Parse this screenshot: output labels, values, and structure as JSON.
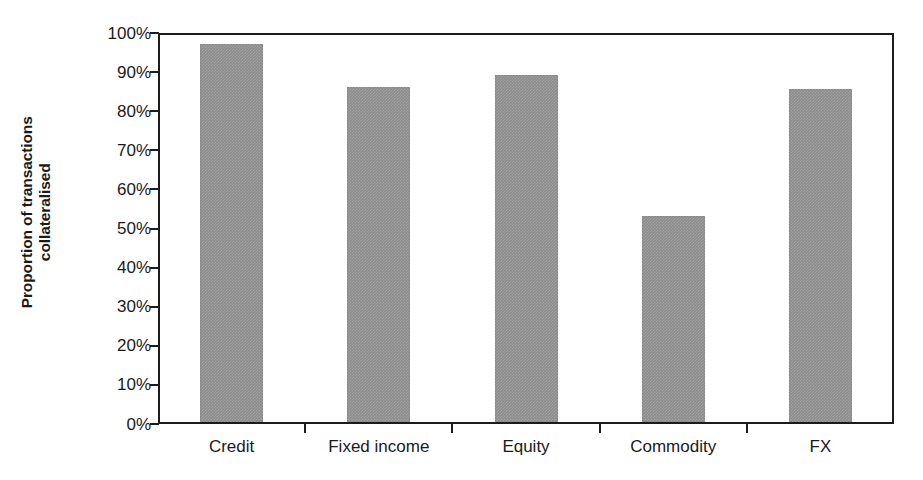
{
  "chart_data": {
    "type": "bar",
    "title": "",
    "subtitle": "",
    "xlabel": "",
    "ylabel": "Proportion of transactions collateralised",
    "ylabel_line1": "Proportion of transactions",
    "ylabel_line2": "collateralised",
    "categories": [
      "Credit",
      "Fixed income",
      "Equity",
      "Commodity",
      "FX"
    ],
    "values": [
      96.7,
      85.7,
      88.7,
      52.7,
      85.2
    ],
    "value_unit": "%",
    "ylim": [
      0,
      100
    ],
    "ytick_values": [
      0,
      10,
      20,
      30,
      40,
      50,
      60,
      70,
      80,
      90,
      100
    ],
    "ytick_labels": [
      "0%",
      "10%",
      "20%",
      "30%",
      "40%",
      "50%",
      "60%",
      "70%",
      "80%",
      "90%",
      "100%"
    ],
    "grid": false,
    "legend": false,
    "legend_position": "none",
    "series": [
      {
        "name": "Proportion collateralised",
        "values": [
          96.7,
          85.7,
          88.7,
          52.7,
          85.2
        ]
      }
    ],
    "colors": {
      "bar_fill": "#8c8c8c",
      "axis": "#1c1c1c",
      "text": "#1a1a1a",
      "background": "#ffffff"
    }
  }
}
